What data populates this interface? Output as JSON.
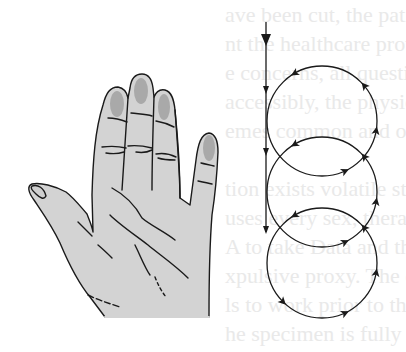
{
  "figure": {
    "bleed_through_text": [
      "ave been cut, the patient's registe",
      "nt the healthcare provider has ethi",
      "e concerns, all questions should be answe",
      "accessibly, the physician has sh",
      "emes common and often disability",
      "",
      "tion exists volatile stimuli",
      "uses every sex, therapy treated",
      "A to take Data and those to work in",
      "xpulsive proxy. The computed",
      "ls to work prior to the specimen o",
      "he specimen is fully placed, nucl"
    ],
    "colors": {
      "skin": "#d3d3d3",
      "nail": "#a9a9a9",
      "ink": "#1a1a1a",
      "bleed_text": "#e9e9e9"
    }
  }
}
